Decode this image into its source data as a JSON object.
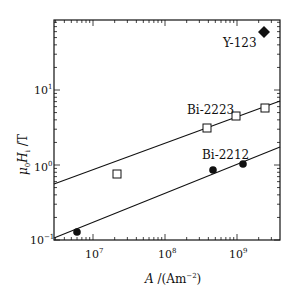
{
  "chart_data": {
    "type": "scatter",
    "title": "",
    "xlabel": "A /(Am^-2)",
    "ylabel": "μ0Hi / T",
    "xscale": "log",
    "yscale": "log",
    "xlim": [
      4000000.0,
      4000000000.0
    ],
    "ylim": [
      0.1,
      100
    ],
    "grid": false,
    "x_tick_labels": [
      "10^7",
      "10^8",
      "10^9"
    ],
    "y_tick_labels": [
      "10^-1",
      "10^0",
      "10^1"
    ],
    "series": [
      {
        "name": "Y-123",
        "marker": "filled-diamond",
        "points": [
          [
            2400000000.0,
            60
          ]
        ]
      },
      {
        "name": "Bi-2223",
        "marker": "open-square",
        "points": [
          [
            21000000.0,
            0.76
          ],
          [
            380000000.0,
            3.1
          ],
          [
            970000000.0,
            4.5
          ],
          [
            2400000000.0,
            5.7
          ]
        ],
        "fit_line": {
          "x": [
            4000000.0,
            4000000000.0
          ],
          "y": [
            0.42,
            6.8
          ]
        }
      },
      {
        "name": "Bi-2212",
        "marker": "filled-circle",
        "points": [
          [
            6000000.0,
            0.13
          ],
          [
            460000000.0,
            0.86
          ],
          [
            1200000000.0,
            1.0
          ]
        ],
        "fit_line": {
          "x": [
            4000000.0,
            4000000000.0
          ],
          "y": [
            0.105,
            1.85
          ]
        }
      }
    ],
    "annotations": [
      "Y-123",
      "Bi-2223",
      "Bi-2212"
    ]
  },
  "labels": {
    "y123": "Y-123",
    "bi2223": "Bi-2223",
    "bi2212": "Bi-2212",
    "x_axis_A": "A",
    "x_axis_unit_open": " /(Am",
    "x_axis_exp": "−2",
    "x_axis_close": ")",
    "y_axis_mu": "μ",
    "y_axis_sub0": "0",
    "y_axis_H": "H",
    "y_axis_subi": "i",
    "y_axis_unit": " /T",
    "xt1_base": "10",
    "xt1_exp": "7",
    "xt2_base": "10",
    "xt2_exp": "8",
    "xt3_base": "10",
    "xt3_exp": "9",
    "yt1_base": "10",
    "yt1_exp": "−1",
    "yt2_base": "10",
    "yt2_exp": "0",
    "yt3_base": "10",
    "yt3_exp": "1"
  }
}
